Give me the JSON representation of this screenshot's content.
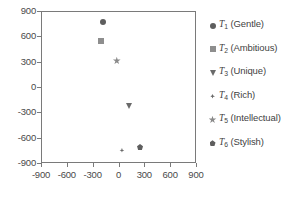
{
  "chart_data": {
    "type": "scatter",
    "title": "",
    "xlabel": "",
    "ylabel": "",
    "xlim": [
      -900,
      900
    ],
    "ylim": [
      -900,
      900
    ],
    "grid": false,
    "legend_position": "right",
    "xticks": [
      "-900",
      "-600",
      "-300",
      "0",
      "300",
      "600",
      "900"
    ],
    "yticks": [
      "900",
      "600",
      "300",
      "0",
      "-300",
      "-600",
      "-900"
    ],
    "xtick_values": [
      -900,
      -600,
      -300,
      0,
      300,
      600,
      900
    ],
    "ytick_values": [
      900,
      600,
      300,
      0,
      -300,
      -600,
      -900
    ],
    "points": [
      {
        "label": "T1 (Gentle)",
        "series": "T",
        "sub": "1",
        "name": "Gentle",
        "x": -180,
        "y": 770,
        "marker": "circle",
        "color": "#5e5e5e"
      },
      {
        "label": "T2 (Ambitious)",
        "series": "T",
        "sub": "2",
        "name": "Ambitious",
        "x": -200,
        "y": 540,
        "marker": "square",
        "color": "#8e8e8e"
      },
      {
        "label": "T3 (Unique)",
        "series": "T",
        "sub": "3",
        "name": "Unique",
        "x": 120,
        "y": -220,
        "marker": "triangle",
        "color": "#6a6a6a"
      },
      {
        "label": "T4 (Rich)",
        "series": "T",
        "sub": "4",
        "name": "Rich",
        "x": 40,
        "y": -750,
        "marker": "diamond",
        "color": "#6a6a6a"
      },
      {
        "label": "T5 (Intellectual)",
        "series": "T",
        "sub": "5",
        "name": "Intellectual",
        "x": -20,
        "y": 310,
        "marker": "star",
        "color": "#8a8a8a"
      },
      {
        "label": "T6 (Stylish)",
        "series": "T",
        "sub": "6",
        "name": "Stylish",
        "x": 250,
        "y": -710,
        "marker": "pentagon",
        "color": "#5e5e5e"
      }
    ]
  },
  "legend": {
    "entries": [
      {
        "symbol": "T",
        "subscript": "1",
        "text": "(Gentle)",
        "marker": "circle"
      },
      {
        "symbol": "T",
        "subscript": "2",
        "text": "(Ambitious)",
        "marker": "square"
      },
      {
        "symbol": "T",
        "subscript": "3",
        "text": "(Unique)",
        "marker": "triangle"
      },
      {
        "symbol": "T",
        "subscript": "4",
        "text": "(Rich)",
        "marker": "diamond"
      },
      {
        "symbol": "T",
        "subscript": "5",
        "text": "(Intellectual)",
        "marker": "star"
      },
      {
        "symbol": "T",
        "subscript": "6",
        "text": "(Stylish)",
        "marker": "pentagon"
      }
    ]
  },
  "axes": {
    "frame_color": "#7a7a7a",
    "tick_color": "#7a7a7a",
    "label_color": "#4a4a4a"
  }
}
